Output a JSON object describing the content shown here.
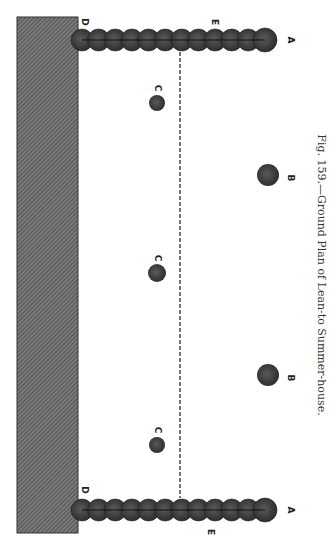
{
  "figure": {
    "caption": "Fig. 159.—Ground Plan of Lean-to Summer-house.",
    "orientation": "rotated 90° clockwise (reads bottom-to-top)"
  },
  "colors": {
    "wall_fill": "#6e6e6e",
    "wall_hatch": "#4a4a4a",
    "column_fill": "#3a3a3a",
    "column_highlight": "#5a5a5a",
    "line": "#1a1a1a",
    "background": "#ffffff"
  },
  "wall": {
    "x": 17,
    "y": 17,
    "width": 61,
    "height": 516
  },
  "chains": [
    {
      "name": "top",
      "y": 40,
      "x_start": 82,
      "x_end": 265,
      "count": 11,
      "end_radius": 12,
      "radius": 11
    },
    {
      "name": "bottom",
      "y": 510,
      "x_start": 82,
      "x_end": 265,
      "count": 11,
      "end_radius": 12,
      "radius": 11
    }
  ],
  "dashed_line": {
    "x": 180,
    "y1": 52,
    "y2": 498
  },
  "posts_c": [
    {
      "cx": 157,
      "cy": 103,
      "r": 8
    },
    {
      "cx": 157,
      "cy": 273,
      "r": 9
    },
    {
      "cx": 157,
      "cy": 445,
      "r": 8
    }
  ],
  "posts_b": [
    {
      "cx": 268,
      "cy": 175,
      "r": 11
    },
    {
      "cx": 268,
      "cy": 375,
      "r": 11
    }
  ],
  "labels": [
    {
      "text": "D",
      "x": 84,
      "y": 22
    },
    {
      "text": "E",
      "x": 214,
      "y": 22
    },
    {
      "text": "A",
      "x": 290,
      "y": 40
    },
    {
      "text": "C",
      "x": 157,
      "y": 88
    },
    {
      "text": "B",
      "x": 290,
      "y": 178
    },
    {
      "text": "C",
      "x": 157,
      "y": 258
    },
    {
      "text": "B",
      "x": 290,
      "y": 378
    },
    {
      "text": "C",
      "x": 157,
      "y": 430
    },
    {
      "text": "D",
      "x": 84,
      "y": 490
    },
    {
      "text": "E",
      "x": 210,
      "y": 532
    },
    {
      "text": "A",
      "x": 290,
      "y": 510
    }
  ]
}
